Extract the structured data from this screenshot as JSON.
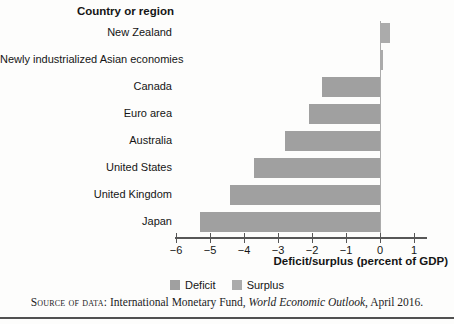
{
  "figure": {
    "column_header": "Country or region",
    "x_axis_label": "Deficit/surplus (percent of GDP)",
    "tick_labels": [
      "−6",
      "−5",
      "−4",
      "−3",
      "−2",
      "−1",
      "0",
      "1"
    ],
    "legend": {
      "deficit_label": "Deficit",
      "surplus_label": "Surplus"
    },
    "colors": {
      "deficit_bar": "#a0a0a0",
      "surplus_bar": "#ababab",
      "axis": "#575757",
      "zero_line": "#ababab"
    },
    "source": {
      "prefix": "Source of data:",
      "body": " International Monetary Fund, ",
      "italic": "World Economic Outlook",
      "suffix": ", April 2016."
    }
  },
  "chart_data": {
    "type": "bar",
    "orientation": "horizontal",
    "title": "Country or region",
    "categories": [
      "New Zealand",
      "Newly industrialized Asian economies",
      "Canada",
      "Euro area",
      "Australia",
      "United States",
      "United Kingdom",
      "Japan"
    ],
    "values": [
      0.3,
      0.1,
      -1.7,
      -2.1,
      -2.8,
      -3.7,
      -4.4,
      -5.3
    ],
    "series_note": "positive values = Surplus, negative values = Deficit",
    "xlabel": "Deficit/surplus (percent of GDP)",
    "ylabel": "Country or region",
    "xlim": [
      -6,
      1
    ],
    "xticks": [
      -6,
      -5,
      -4,
      -3,
      -2,
      -1,
      0,
      1
    ],
    "grid": false,
    "legend": [
      "Deficit",
      "Surplus"
    ],
    "legend_position": "bottom-center",
    "source": "Source of data: International Monetary Fund, World Economic Outlook, April 2016."
  }
}
